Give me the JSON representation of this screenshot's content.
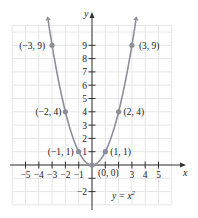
{
  "chart_data": {
    "type": "line",
    "title": "",
    "equation_label": "y = x",
    "equation_exponent": "2",
    "xlabel": "x",
    "ylabel": "y",
    "xlim": [
      -6,
      6
    ],
    "ylim": [
      -3,
      10.5
    ],
    "grid": true,
    "x_ticks": [
      -5,
      -4,
      -3,
      -2,
      -1,
      3,
      4,
      5
    ],
    "x_tick_labels": [
      "−5",
      "−4",
      "−3",
      "−2",
      "−1",
      "3",
      "4",
      "5"
    ],
    "y_ticks": [
      1,
      2,
      3,
      4,
      5,
      6,
      7,
      8,
      9,
      -2
    ],
    "y_tick_labels": [
      "1",
      "2",
      "3",
      "4",
      "5",
      "6",
      "7",
      "8",
      "9",
      "−2"
    ],
    "series": [
      {
        "name": "y = x^2",
        "color": "#8e8e9a",
        "x": [
          -3,
          -2,
          -1,
          0,
          1,
          2,
          3
        ],
        "y": [
          9,
          4,
          1,
          0,
          1,
          4,
          9
        ]
      }
    ],
    "point_labels": [
      {
        "x": -3,
        "y": 9,
        "label": "(−3, 9)"
      },
      {
        "x": -2,
        "y": 4,
        "label": "(−2, 4)"
      },
      {
        "x": -1,
        "y": 1,
        "label": "(−1, 1)"
      },
      {
        "x": 0,
        "y": 0,
        "label": "(0, 0)"
      },
      {
        "x": 1,
        "y": 1,
        "label": "(1, 1)"
      },
      {
        "x": 2,
        "y": 4,
        "label": "(2, 4)"
      },
      {
        "x": 3,
        "y": 9,
        "label": "(3, 9)"
      }
    ]
  }
}
